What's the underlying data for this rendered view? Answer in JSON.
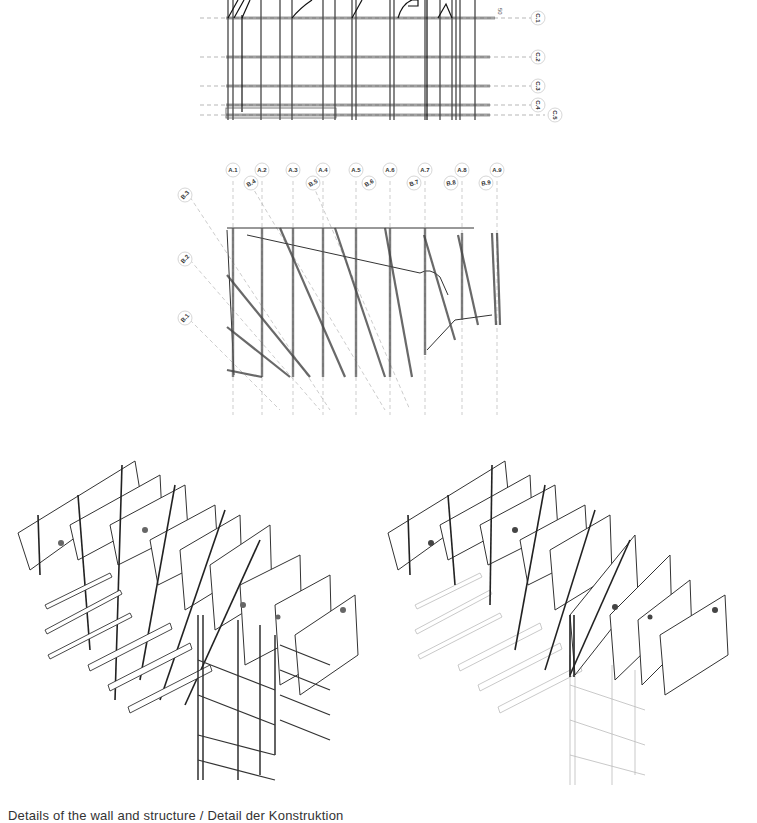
{
  "document": {
    "caption": "Details of the wall and structure / Detail der Konstruktion"
  },
  "elevation": {
    "grid_lines": [
      {
        "label": "C.1",
        "y": 18
      },
      {
        "label": "C.2",
        "y": 57
      },
      {
        "label": "C.3",
        "y": 86
      },
      {
        "label": "C.4",
        "y": 105
      },
      {
        "label": "C.5",
        "y": 115
      }
    ],
    "top_note": "50"
  },
  "plan": {
    "grid_a": [
      {
        "label": "A.1",
        "x": 233
      },
      {
        "label": "A.2",
        "x": 262
      },
      {
        "label": "A.3",
        "x": 293
      },
      {
        "label": "A.4",
        "x": 323
      },
      {
        "label": "A.5",
        "x": 356
      },
      {
        "label": "A.6",
        "x": 390
      },
      {
        "label": "A.7",
        "x": 425
      },
      {
        "label": "A.8",
        "x": 462
      },
      {
        "label": "A.9",
        "x": 497
      }
    ],
    "grid_b_top": [
      {
        "label": "B.4",
        "x": 251
      },
      {
        "label": "B.5",
        "x": 313
      },
      {
        "label": "B.6",
        "x": 369
      },
      {
        "label": "B.7",
        "x": 414
      },
      {
        "label": "B.8",
        "x": 451
      },
      {
        "label": "B.9",
        "x": 486
      }
    ],
    "grid_b_left": [
      {
        "label": "B.3",
        "y": 195
      },
      {
        "label": "B.2",
        "y": 259
      },
      {
        "label": "B.1",
        "y": 318
      }
    ]
  },
  "axonometrics": [
    {
      "name": "full-structure",
      "style": "dark"
    },
    {
      "name": "wall-panels-highlighted",
      "style": "faded-substructure"
    }
  ]
}
